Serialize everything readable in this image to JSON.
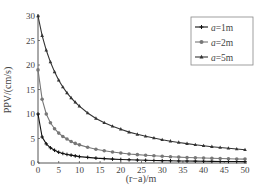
{
  "chart_data": {
    "type": "line",
    "title": "",
    "xlabel": "(r−a)/m",
    "ylabel": "PPV/(cm/s)",
    "xlim": [
      0,
      50
    ],
    "ylim": [
      0,
      30
    ],
    "x_ticks": [
      "0",
      "5",
      "10",
      "15",
      "20",
      "25",
      "30",
      "35",
      "40",
      "45",
      "50"
    ],
    "y_ticks": [
      "0",
      "5",
      "10",
      "15",
      "20",
      "25",
      "30"
    ],
    "grid": false,
    "legend_position": "upper right",
    "x": [
      0,
      1,
      2,
      3,
      4,
      5,
      6,
      7,
      8,
      9,
      10,
      12,
      14,
      16,
      18,
      20,
      22,
      24,
      26,
      28,
      30,
      32,
      34,
      36,
      38,
      40,
      42,
      44,
      46,
      48,
      50
    ],
    "series": [
      {
        "name": "a=1m",
        "color": "#111111",
        "marker": "plus",
        "values": [
          10.0,
          5.3,
          3.9,
          3.1,
          2.6,
          2.2,
          1.95,
          1.75,
          1.6,
          1.45,
          1.3,
          1.15,
          1.0,
          0.9,
          0.8,
          0.72,
          0.66,
          0.6,
          0.56,
          0.52,
          0.48,
          0.45,
          0.42,
          0.4,
          0.38,
          0.36,
          0.34,
          0.32,
          0.31,
          0.3,
          0.28
        ]
      },
      {
        "name": "a=2m",
        "color": "#777777",
        "marker": "circle",
        "values": [
          19.0,
          13.0,
          10.0,
          8.2,
          7.0,
          6.1,
          5.4,
          4.9,
          4.4,
          4.0,
          3.7,
          3.2,
          2.8,
          2.5,
          2.25,
          2.05,
          1.85,
          1.7,
          1.58,
          1.47,
          1.37,
          1.28,
          1.2,
          1.13,
          1.07,
          1.01,
          0.96,
          0.91,
          0.87,
          0.83,
          0.8
        ]
      },
      {
        "name": "a=5m",
        "color": "#333333",
        "marker": "triangle",
        "values": [
          30.0,
          26.0,
          23.0,
          20.6,
          18.6,
          16.9,
          15.5,
          14.3,
          13.3,
          12.4,
          11.6,
          10.2,
          9.1,
          8.2,
          7.5,
          6.9,
          6.3,
          5.85,
          5.45,
          5.1,
          4.75,
          4.45,
          4.2,
          3.95,
          3.72,
          3.52,
          3.33,
          3.15,
          3.0,
          2.85,
          2.7
        ]
      }
    ]
  },
  "legend": {
    "items": [
      {
        "label": "a=1m"
      },
      {
        "label": "a=2m"
      },
      {
        "label": "a=5m"
      }
    ]
  }
}
